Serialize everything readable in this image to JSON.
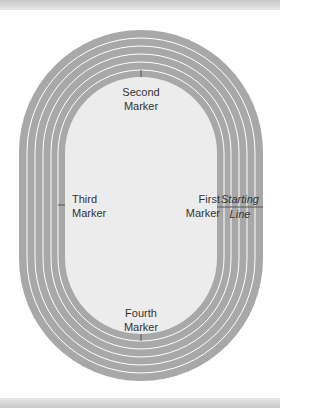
{
  "diagram": {
    "colors": {
      "track": "#a8a8a8",
      "infield": "#ececec",
      "lane_line": "#ffffff",
      "text": "#333333"
    },
    "lanes": 6,
    "labels": {
      "second_marker": [
        "Second",
        "Marker"
      ],
      "first_marker": [
        "First",
        "Marker"
      ],
      "third_marker": [
        "Third",
        "Marker"
      ],
      "fourth_marker": [
        "Fourth",
        "Marker"
      ],
      "starting_line": [
        "Starting",
        "Line"
      ]
    }
  }
}
